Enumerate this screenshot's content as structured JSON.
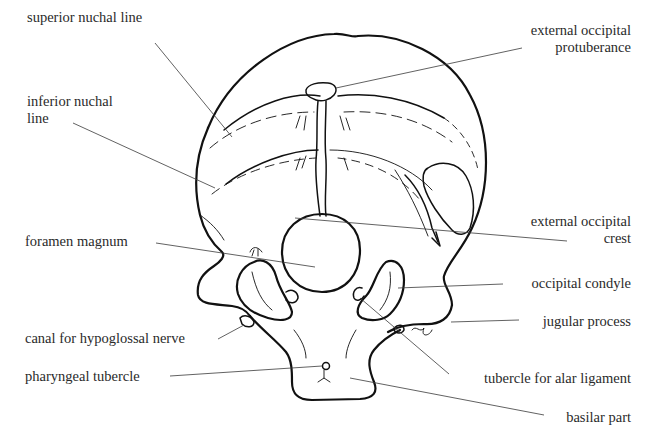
{
  "figure": {
    "labels": [
      {
        "id": "superior-nuchal-line",
        "text": [
          "superior nuchal line"
        ],
        "x": 27,
        "y": 17,
        "align": "left",
        "leader": [
          [
            155,
            43
          ],
          [
            232,
            137
          ]
        ]
      },
      {
        "id": "inferior-nuchal-line",
        "text": [
          "inferior nuchal",
          "line"
        ],
        "x": 27,
        "y": 99,
        "align": "left",
        "leader": [
          [
            73,
            123
          ],
          [
            215,
            188
          ]
        ]
      },
      {
        "id": "external-occipital-protuberance",
        "text": [
          "external occipital",
          "protuberance"
        ],
        "x": 623,
        "y": 26,
        "align": "right",
        "leader": [
          [
            522,
            48
          ],
          [
            336,
            88
          ]
        ]
      },
      {
        "id": "external-occipital-crest",
        "text": [
          "external occipital",
          "crest"
        ],
        "x": 628,
        "y": 219,
        "align": "right",
        "leader": [
          [
            295,
            218
          ],
          [
            567,
            241
          ]
        ]
      },
      {
        "id": "foramen-magnum",
        "text": [
          "foramen magnum"
        ],
        "x": 25,
        "y": 232,
        "align": "left",
        "leader": [
          [
            156,
            243
          ],
          [
            315,
            267
          ]
        ]
      },
      {
        "id": "occipital-condyle",
        "text": [
          "occipital condyle"
        ],
        "x": 628,
        "y": 276,
        "align": "right",
        "leader": [
          [
            398,
            288
          ],
          [
            503,
            284
          ]
        ]
      },
      {
        "id": "jugular-process",
        "text": [
          "jugular process"
        ],
        "x": 628,
        "y": 314,
        "align": "right",
        "leader": [
          [
            451,
            322
          ],
          [
            519,
            320
          ]
        ]
      },
      {
        "id": "canal-for-hypoglossal-nerve",
        "text": [
          "canal for hypoglossal nerve"
        ],
        "x": 25,
        "y": 330,
        "align": "left",
        "leader": [
          [
            218,
            339
          ],
          [
            244,
            325
          ]
        ]
      },
      {
        "id": "pharyngeal-tubercle",
        "text": [
          "pharyngeal tubercle"
        ],
        "x": 25,
        "y": 370,
        "align": "left",
        "leader": [
          [
            170,
            376
          ],
          [
            322,
            366
          ]
        ]
      },
      {
        "id": "tubercle-for-alar-ligament",
        "text": [
          "tubercle for alar ligament"
        ],
        "x": 628,
        "y": 371,
        "align": "right",
        "leader": [
          [
            360,
            298
          ],
          [
            449,
            374
          ]
        ]
      },
      {
        "id": "basilar-part",
        "text": [
          "basilar part"
        ],
        "x": 628,
        "y": 411,
        "align": "right",
        "leader": [
          [
            350,
            378
          ],
          [
            544,
            415
          ]
        ]
      }
    ]
  }
}
